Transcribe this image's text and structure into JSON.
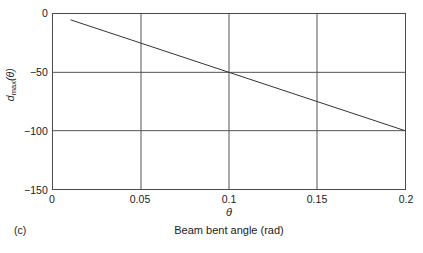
{
  "figure": {
    "panel_label": "(c)",
    "caption": "Beam bent angle (rad)"
  },
  "axes": {
    "xlabel": "θ",
    "ylabel_base": "d",
    "ylabel_sub": "max",
    "ylabel_arg": "(θ)",
    "ylabel_full": "d_max(θ)",
    "xticks": [
      "0",
      "0.05",
      "0.1",
      "0.15",
      "0.2"
    ],
    "yticks": [
      "0",
      "−50",
      "−100",
      "−150"
    ]
  },
  "style": {
    "line_color": "#333333",
    "grid_color": "#555555",
    "frame_color": "#4a4a4a",
    "background": "#ffffff",
    "text_color": "#1a1a1a"
  },
  "chart_data": {
    "type": "line",
    "title": "",
    "subtitle": "",
    "xlabel": "θ",
    "ylabel": "d_max(θ)",
    "caption": "Beam bent angle (rad)",
    "panel": "(c)",
    "xlim": [
      0,
      0.2
    ],
    "ylim": [
      -150,
      0
    ],
    "xticks": [
      0,
      0.05,
      0.1,
      0.15,
      0.2
    ],
    "yticks": [
      0,
      -50,
      -100,
      -150
    ],
    "xtick_labels": [
      "0",
      "0.05",
      "0.1",
      "0.15",
      "0.2"
    ],
    "ytick_labels": [
      "0",
      "−50",
      "−100",
      "−150"
    ],
    "grid": true,
    "grid_x": [
      0.05,
      0.1,
      0.15
    ],
    "grid_y": [
      -50,
      -100
    ],
    "legend": null,
    "series": [
      {
        "name": "d_max(θ)",
        "color": "#333333",
        "x": [
          0.01,
          0.05,
          0.1,
          0.15,
          0.2
        ],
        "y": [
          -5,
          -25,
          -50,
          -75,
          -100
        ]
      }
    ]
  }
}
